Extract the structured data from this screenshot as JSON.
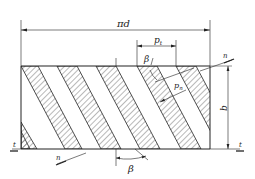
{
  "figure": {
    "type": "helical-gear-pitch-development",
    "labels": {
      "circumference": "πd",
      "transverse_pitch": "p",
      "transverse_pitch_sub": "t",
      "normal_pitch": "p",
      "normal_pitch_sub": "n",
      "helix_angle_top": "β",
      "helix_angle_bottom": "β",
      "face_width": "b",
      "section_n_top": "n",
      "section_n_bottom": "n",
      "section_t_left": "t",
      "section_t_right": "t"
    },
    "colors": {
      "line": "#222222",
      "background": "#ffffff"
    }
  }
}
